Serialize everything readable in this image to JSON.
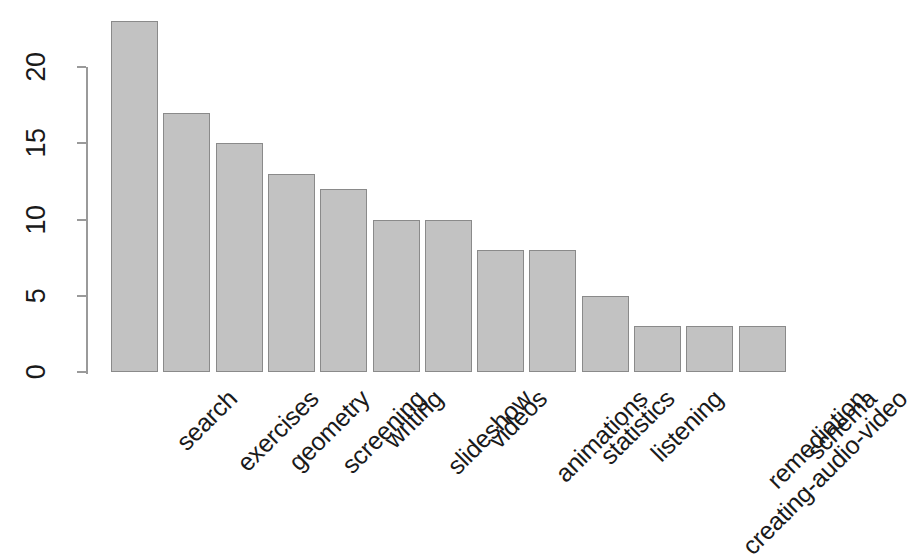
{
  "chart_data": {
    "type": "bar",
    "title": "",
    "subtitle": "",
    "xlabel": "",
    "ylabel": "",
    "categories": [
      "search",
      "exercises",
      "geometry",
      "screening",
      "writing",
      "slideshow",
      "videos",
      "animations",
      "statistics",
      "listening",
      "creating-audio-video",
      "remediation",
      "schema"
    ],
    "values": [
      23,
      17,
      15,
      13,
      12,
      10,
      10,
      8,
      8,
      5,
      3,
      3,
      3
    ],
    "ylim": [
      0,
      23
    ],
    "y_ticks": [
      0,
      5,
      10,
      15,
      20
    ],
    "y_tick_labels": [
      "0",
      "5",
      "10",
      "15",
      "20"
    ],
    "grid": false,
    "legend": null,
    "legend_position": "none",
    "bar_fill_color": "#c2c2c2",
    "bar_border_color": "#8a8a8a",
    "axis_color": "#9a9a9a",
    "text_color": "#1a1a1a",
    "x_tick_label_rotation_deg": -45,
    "y_tick_label_rotation_deg": -90
  }
}
